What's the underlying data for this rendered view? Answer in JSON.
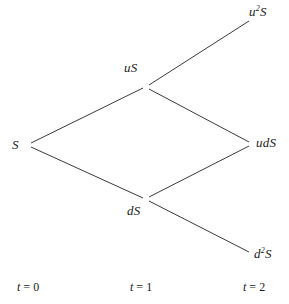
{
  "figure": {
    "type": "binomial-tree-diagram",
    "title": "",
    "background_color": "#ffffff",
    "line_color": "#3a3a3a",
    "text_color": "#1a1a1a",
    "width": 289,
    "height": 304
  },
  "nodes": [
    {
      "id": "s",
      "label_plain": "S",
      "base": "S",
      "exponent": "",
      "prefix": "",
      "x": 29,
      "y": 145,
      "time_step": 0
    },
    {
      "id": "us",
      "label_plain": "uS",
      "base": "S",
      "exponent": "",
      "prefix": "u",
      "x": 146,
      "y": 87,
      "time_step": 1
    },
    {
      "id": "ds",
      "label_plain": "dS",
      "base": "S",
      "exponent": "",
      "prefix": "d",
      "x": 146,
      "y": 199,
      "time_step": 1
    },
    {
      "id": "u2s",
      "label_plain": "u2S",
      "base": "S",
      "exponent": "2",
      "prefix": "u",
      "x": 250,
      "y": 20,
      "time_step": 2
    },
    {
      "id": "uds",
      "label_plain": "udS",
      "base": "S",
      "exponent": "",
      "prefix": "ud",
      "x": 251,
      "y": 144,
      "time_step": 2
    },
    {
      "id": "d2s",
      "label_plain": "d2S",
      "base": "S",
      "exponent": "2",
      "prefix": "d",
      "x": 250,
      "y": 253,
      "time_step": 2
    }
  ],
  "node_labels": {
    "s": "S",
    "us": "uS",
    "ds": "dS",
    "u2s_prefix": "u",
    "u2s_exponent": "2",
    "u2s_suffix": "S",
    "uds": "udS",
    "d2s_prefix": "d",
    "d2s_exponent": "2",
    "d2s_suffix": "S"
  },
  "edges": [
    {
      "id": "edge-s-us",
      "from": "s",
      "to": "us",
      "x1": 31,
      "y1": 143,
      "x2": 143,
      "y2": 88
    },
    {
      "id": "edge-s-ds",
      "from": "s",
      "to": "ds",
      "x1": 31,
      "y1": 147,
      "x2": 143,
      "y2": 198
    },
    {
      "id": "edge-us-u2s",
      "from": "us",
      "to": "u2s",
      "x1": 149,
      "y1": 85,
      "x2": 249,
      "y2": 21
    },
    {
      "id": "edge-us-uds",
      "from": "us",
      "to": "uds",
      "x1": 149,
      "y1": 89,
      "x2": 249,
      "y2": 142
    },
    {
      "id": "edge-ds-uds",
      "from": "ds",
      "to": "uds",
      "x1": 149,
      "y1": 197,
      "x2": 249,
      "y2": 146
    },
    {
      "id": "edge-ds-d2s",
      "from": "ds",
      "to": "d2s",
      "x1": 149,
      "y1": 201,
      "x2": 249,
      "y2": 252
    }
  ],
  "time_axis": {
    "label_0": "t = 0",
    "label_1": "t = 1",
    "label_2": "t = 2",
    "var": "t",
    "values": [
      "0",
      "1",
      "2"
    ],
    "y": 287
  }
}
